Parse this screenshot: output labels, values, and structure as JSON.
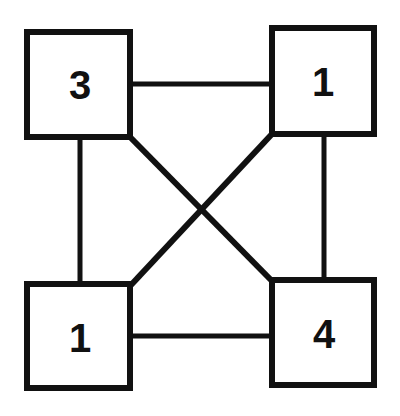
{
  "diagram": {
    "type": "graph",
    "colors": {
      "stroke": "#111111",
      "background": "#ffffff",
      "box_fill": "#ffffff"
    },
    "nodes": [
      {
        "id": "top-left",
        "label": "3",
        "x": 27,
        "y": 32,
        "w": 103,
        "h": 105
      },
      {
        "id": "top-right",
        "label": "1",
        "x": 272,
        "y": 28,
        "w": 102,
        "h": 106
      },
      {
        "id": "bottom-left",
        "label": "1",
        "x": 27,
        "y": 284,
        "w": 103,
        "h": 104
      },
      {
        "id": "bottom-right",
        "label": "4",
        "x": 272,
        "y": 280,
        "w": 102,
        "h": 105
      }
    ],
    "edges": [
      {
        "from": "top-left",
        "to": "top-right",
        "kind": "horizontal"
      },
      {
        "from": "top-left",
        "to": "bottom-left",
        "kind": "vertical"
      },
      {
        "from": "top-right",
        "to": "bottom-right",
        "kind": "vertical"
      },
      {
        "from": "bottom-left",
        "to": "bottom-right",
        "kind": "horizontal"
      },
      {
        "from": "top-left",
        "to": "bottom-right",
        "kind": "diagonal"
      },
      {
        "from": "top-right",
        "to": "bottom-left",
        "kind": "diagonal"
      }
    ]
  }
}
